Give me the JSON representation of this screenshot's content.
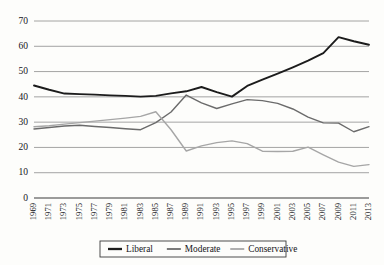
{
  "chart_data": {
    "type": "line",
    "title": "",
    "subtitle": "",
    "xlabel": "",
    "ylabel": "",
    "x": [
      1969,
      1971,
      1973,
      1975,
      1977,
      1979,
      1981,
      1983,
      1985,
      1987,
      1989,
      1991,
      1993,
      1995,
      1997,
      1999,
      2001,
      2003,
      2005,
      2007,
      2009,
      2011,
      2013
    ],
    "xtick_labels": [
      "1969",
      "1971",
      "1973",
      "1975",
      "1977",
      "1979",
      "1981",
      "1983",
      "1985",
      "1987",
      "1989",
      "1991",
      "1993",
      "1995",
      "1997",
      "1999",
      "2001",
      "2003",
      "2005",
      "2007",
      "2009",
      "2011",
      "2013"
    ],
    "ytick_labels": [
      "0",
      "10",
      "20",
      "30",
      "40",
      "50",
      "60",
      "70"
    ],
    "yticks": [
      0,
      10,
      20,
      30,
      40,
      50,
      60,
      70
    ],
    "ylim": [
      0,
      70
    ],
    "xlim": [
      1969,
      2013
    ],
    "grid": "horizontal",
    "legend_position": "bottom-center",
    "series": [
      {
        "name": "Liberal",
        "color": "#1c1c1c",
        "width": 1.9,
        "values": [
          44.5,
          42.8,
          41.3,
          41.1,
          40.9,
          40.6,
          40.4,
          40.1,
          40.4,
          41.4,
          42.2,
          43.9,
          41.9,
          40.1,
          44.3,
          46.8,
          49.2,
          51.7,
          54.3,
          57.3,
          63.6,
          62.0,
          60.6
        ]
      },
      {
        "name": "Moderate",
        "color": "#6b6b6b",
        "width": 1.4,
        "values": [
          27.3,
          27.9,
          28.5,
          28.8,
          28.3,
          27.9,
          27.4,
          27.0,
          29.8,
          34.0,
          40.7,
          37.6,
          35.4,
          37.2,
          38.9,
          38.5,
          37.4,
          35.2,
          32.0,
          29.7,
          29.6,
          26.2,
          28.2
        ]
      },
      {
        "name": "Conservative",
        "color": "#a6a6a6",
        "width": 1.4,
        "values": [
          28.2,
          28.6,
          29.2,
          29.8,
          30.4,
          31.0,
          31.6,
          32.3,
          34.1,
          27.0,
          18.6,
          20.6,
          21.9,
          22.6,
          21.5,
          18.5,
          18.4,
          18.5,
          20.1,
          17.1,
          14.2,
          12.5,
          13.2
        ]
      }
    ]
  },
  "legend": {
    "items": [
      {
        "label": "Liberal"
      },
      {
        "label": "Moderate"
      },
      {
        "label": "Conservative"
      }
    ]
  }
}
